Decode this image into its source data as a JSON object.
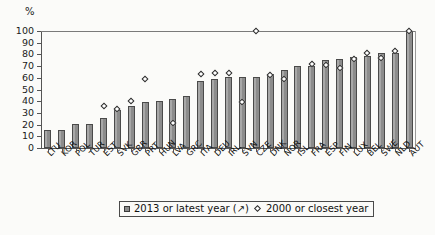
{
  "axis": {
    "unit_label": "%",
    "y_ticks": [
      0,
      10,
      20,
      30,
      40,
      50,
      60,
      70,
      80,
      90,
      100
    ]
  },
  "legend": {
    "series1_label": "2013 or latest year (↗)",
    "series2_label": "2000 or closest year",
    "series1_marker": "filled-square-marker",
    "series2_marker": "open-diamond-marker"
  },
  "chart_data": {
    "type": "bar",
    "title": "",
    "xlabel": "",
    "ylabel": "%",
    "ylim": [
      0,
      100
    ],
    "grid": false,
    "legend_position": "bottom",
    "categories": [
      "LTU",
      "KOR",
      "POL",
      "TUR",
      "EST",
      "SVK",
      "GBR",
      "PRT",
      "HUN",
      "LVA",
      "GRC",
      "ITA",
      "DEU",
      "IRL",
      "SVN",
      "CZE",
      "DNK",
      "NOR",
      "ISL",
      "FRA",
      "ESP",
      "FIN",
      "LUX",
      "BEL",
      "SWE",
      "NLD",
      "AUT"
    ],
    "series": [
      {
        "name": "2013 or latest year (↗)",
        "type": "bar",
        "values": [
          15,
          15.5,
          20.5,
          20.5,
          26,
          32.5,
          35.5,
          39,
          40.5,
          41.5,
          44.5,
          57,
          59,
          60.5,
          61,
          61,
          63,
          67,
          70,
          70.5,
          75,
          76.5,
          78,
          79,
          81,
          81.5,
          100
        ]
      },
      {
        "name": "2000 or closest year",
        "type": "scatter",
        "values": [
          null,
          null,
          null,
          null,
          35.5,
          33.5,
          40.5,
          59,
          null,
          21,
          null,
          63,
          64,
          64.5,
          39,
          100,
          62.5,
          59,
          null,
          72,
          71,
          68,
          76,
          81,
          77,
          83,
          100
        ]
      }
    ]
  }
}
